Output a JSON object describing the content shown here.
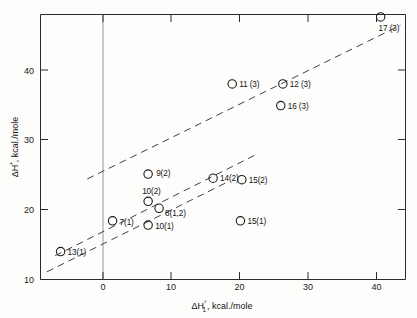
{
  "figure": {
    "title": "",
    "background_color": "#fdfdfc",
    "ink_color": "#1c1c1c"
  },
  "axes": {
    "x": {
      "label_delta": "Δ",
      "label_h": "H",
      "label_sup": "°",
      "label_sub": "1",
      "label_rest": ", kcal./mole",
      "label_full": "ΔH°₁, kcal./mole",
      "ticks": [
        "0",
        "10",
        "20",
        "30",
        "40"
      ],
      "tick_values": [
        0,
        10,
        20,
        30,
        40
      ],
      "range": [
        -9,
        44
      ]
    },
    "y": {
      "label_delta": "Δ",
      "label_h": "H",
      "label_sup": "*",
      "label_rest": ", kcal./mole",
      "label_full": "ΔH*, kcal./mole",
      "ticks": [
        "20",
        "30",
        "40"
      ],
      "tick_values": [
        20,
        30,
        40
      ],
      "range": [
        10.6,
        48.6
      ]
    }
  },
  "chart_data": {
    "type": "scatter",
    "title": "",
    "xlabel": "ΔH°₁, kcal./mole",
    "ylabel": "ΔH*, kcal./mole",
    "xlim": [
      -9,
      44
    ],
    "ylim": [
      10.6,
      48.6
    ],
    "xticks": [
      0,
      10,
      20,
      30,
      40
    ],
    "yticks": [
      20,
      30,
      40
    ],
    "grid": false,
    "legend": "none",
    "marker": "open-circle",
    "points": [
      {
        "label": "13(1)",
        "x": -6.2,
        "y": 14.0,
        "label_dx": 7,
        "label_dy": 3
      },
      {
        "label": "7(1)",
        "x": 1.4,
        "y": 18.4,
        "label_dx": 7,
        "label_dy": 4
      },
      {
        "label": "10(2)",
        "x": 6.6,
        "y": 21.2,
        "label_dx": -6,
        "label_dy": -7
      },
      {
        "label": "10(1)",
        "x": 6.6,
        "y": 17.8,
        "label_dx": 7,
        "label_dy": 4
      },
      {
        "label": "9(2)",
        "x": 6.6,
        "y": 25.1,
        "label_dx": 8,
        "label_dy": 2
      },
      {
        "label": "8(1,2)",
        "x": 8.2,
        "y": 20.2,
        "label_dx": 6,
        "label_dy": 8
      },
      {
        "label": "14(2)",
        "x": 16.1,
        "y": 24.5,
        "label_dx": 7,
        "label_dy": 3
      },
      {
        "label": "15(2)",
        "x": 20.3,
        "y": 24.3,
        "label_dx": 7,
        "label_dy": 3
      },
      {
        "label": "15(1)",
        "x": 20.1,
        "y": 18.4,
        "label_dx": 7,
        "label_dy": 3
      },
      {
        "label": "11 (3)",
        "x": 18.9,
        "y": 38.0,
        "label_dx": 7,
        "label_dy": 3
      },
      {
        "label": "12 (3)",
        "x": 26.3,
        "y": 38.0,
        "label_dx": 7,
        "label_dy": 3
      },
      {
        "label": "16 (3)",
        "x": 26.0,
        "y": 34.9,
        "label_dx": 7,
        "label_dy": 3
      },
      {
        "label": "17 (3)",
        "x": 40.6,
        "y": 47.6,
        "label_dx": -2,
        "label_dy": 14
      }
    ],
    "trend_lines": [
      {
        "name": "upper-correlation-line",
        "x1": -2.3,
        "y1": 24.4,
        "x2": 43.5,
        "y2": 46.4
      },
      {
        "name": "middle-correlation-line",
        "x1": -7.0,
        "y1": 13.4,
        "x2": 22.4,
        "y2": 27.9
      },
      {
        "name": "lower-correlation-line",
        "x1": -8.2,
        "y1": 11.1,
        "x2": 18.3,
        "y2": 24.0
      }
    ]
  }
}
